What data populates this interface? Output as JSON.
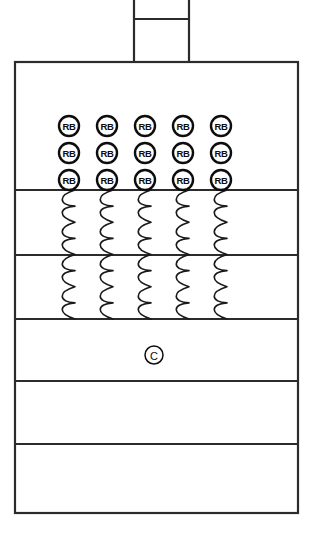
{
  "diagram": {
    "background_color": "#ffffff",
    "line_color": "#2b2b2b",
    "canvas": {
      "width": 314,
      "height": 538
    },
    "neck": {
      "label": "neck-outlet",
      "x": 134,
      "y": 0,
      "width": 55,
      "height": 62,
      "divider_y": 19
    },
    "body": {
      "label": "vessel-body",
      "x": 15,
      "y": 62,
      "width": 283,
      "height": 451
    },
    "dividers": [
      {
        "name": "divider-1",
        "y": 190
      },
      {
        "name": "divider-2",
        "y": 255
      },
      {
        "name": "divider-3",
        "y": 319
      },
      {
        "name": "divider-4",
        "y": 381
      },
      {
        "name": "divider-5",
        "y": 444
      }
    ],
    "badge_grid": {
      "label": "RB",
      "rows": 3,
      "columns": 5,
      "radius": 10,
      "column_centers": [
        69,
        107,
        145,
        183,
        221
      ],
      "row_centers": [
        126,
        153,
        180
      ],
      "count": 15
    },
    "coil_columns": {
      "label": "coil-bundle",
      "column_x": [
        75,
        113,
        151,
        189,
        227
      ],
      "top_y": 190,
      "bottom_y": 319,
      "loop_height": 32.25,
      "loop_width": 17,
      "loops_per_column": 4
    },
    "center_mark": {
      "label": "C",
      "cx": 154,
      "cy": 355,
      "radius": 9
    },
    "sections": [
      {
        "name": "section-plenum",
        "label": ""
      },
      {
        "name": "section-coil-upper",
        "label": ""
      },
      {
        "name": "section-coil-lower",
        "label": ""
      },
      {
        "name": "section-core-center",
        "label": ""
      },
      {
        "name": "section-lower-a",
        "label": ""
      },
      {
        "name": "section-lower-b",
        "label": ""
      }
    ]
  }
}
